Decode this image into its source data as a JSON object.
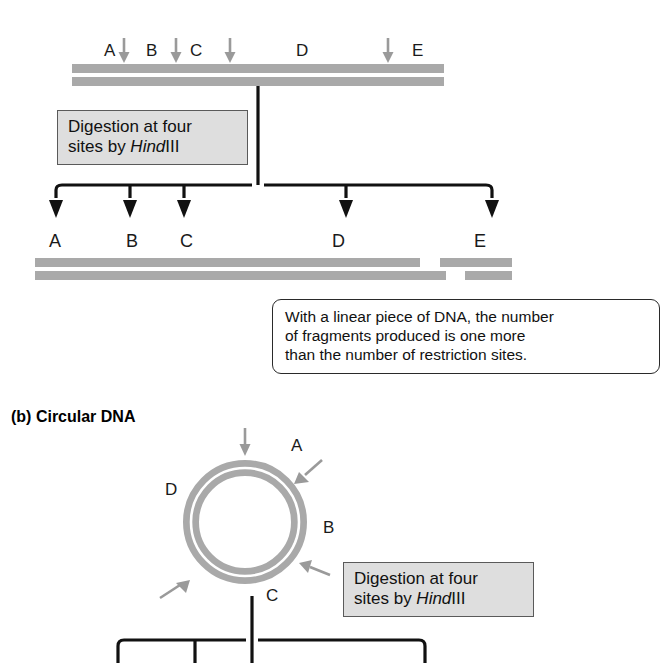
{
  "figure": {
    "panel_b_title": "(b)  Circular DNA",
    "enzyme_plain": "III",
    "enzyme_italic": "Hind"
  },
  "linear": {
    "site_labels": [
      "A",
      "B",
      "C",
      "D",
      "E"
    ],
    "site_label_x": [
      104,
      146,
      190,
      296,
      412
    ],
    "cut_arrow_x": [
      124,
      176,
      230,
      388
    ],
    "strand": {
      "x": 72,
      "y": 64,
      "width": 372,
      "gap": 4
    },
    "callout": {
      "line1": "Digestion at four",
      "line2_prefix": "sites by ",
      "line2_italic": "Hind",
      "line2_suffix": "III"
    },
    "fragment_labels": [
      "A",
      "B",
      "C",
      "D",
      "E"
    ],
    "fragment_label_x": [
      49,
      126,
      180,
      332,
      474
    ],
    "fragment_arrow_x": [
      56,
      130,
      184,
      346,
      492
    ],
    "fragments": [
      {
        "name": "A",
        "top_x": 35,
        "top_w": 73,
        "bottom_x": 35,
        "bottom_w": 99
      },
      {
        "name": "B",
        "top_x": 97,
        "top_w": 89,
        "bottom_x": 122,
        "bottom_w": 88
      },
      {
        "name": "C",
        "top_x": 173,
        "top_w": 89,
        "bottom_x": 198,
        "bottom_w": 90
      },
      {
        "name": "D",
        "top_x": 258,
        "top_w": 162,
        "bottom_x": 283,
        "bottom_w": 163
      },
      {
        "name": "E",
        "top_x": 440,
        "top_w": 72,
        "bottom_x": 465,
        "bottom_w": 47
      }
    ],
    "note": {
      "line1": "With a linear piece of DNA, the number",
      "line2": "of fragments produced is one more",
      "line3": "than the number of restriction sites."
    }
  },
  "circular": {
    "center_x": 245,
    "center_y": 522,
    "outer_radius": 62,
    "ring_thickness": 17,
    "site_labels": [
      "A",
      "B",
      "C",
      "D"
    ],
    "label_positions": [
      {
        "label": "A",
        "x": 291,
        "y": 446
      },
      {
        "label": "B",
        "x": 323,
        "y": 519
      },
      {
        "label": "C",
        "x": 266,
        "y": 592
      },
      {
        "label": "D",
        "x": 165,
        "y": 489
      }
    ],
    "callout": {
      "line1": "Digestion at four",
      "line2_prefix": "sites by ",
      "line2_italic": "Hind",
      "line2_suffix": "III"
    },
    "branch_x": [
      118,
      195,
      252,
      425
    ],
    "stem_x": 252
  },
  "colors": {
    "dna_gray": "#a9a9a9",
    "arrow_gray": "#9a9a9a",
    "arrow_black": "#111111",
    "box_gray_fill": "#dedede",
    "box_border": "#5a5a5a",
    "note_border": "#2a2a2a"
  }
}
